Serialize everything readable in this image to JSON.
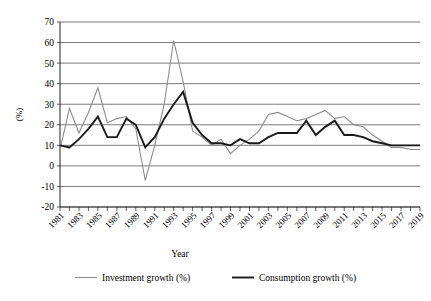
{
  "chart_data": {
    "type": "line",
    "title": "",
    "xlabel": "Year",
    "ylabel": "(%)",
    "ylim": [
      -20,
      70
    ],
    "ytick_step": 10,
    "yticks": [
      70,
      60,
      50,
      40,
      30,
      20,
      10,
      0,
      -10,
      -20
    ],
    "grid": true,
    "grid_axis": "y",
    "legend_position": "bottom",
    "x": [
      1981,
      1982,
      1983,
      1984,
      1985,
      1986,
      1987,
      1988,
      1989,
      1990,
      1991,
      1992,
      1993,
      1994,
      1995,
      1996,
      1997,
      1998,
      1999,
      2000,
      2001,
      2002,
      2003,
      2004,
      2005,
      2006,
      2007,
      2008,
      2009,
      2010,
      2011,
      2012,
      2013,
      2014,
      2015,
      2016,
      2017,
      2018,
      2019
    ],
    "xtick_labels": [
      "1981",
      "1983",
      "1985",
      "1987",
      "1989",
      "1991",
      "1993",
      "1995",
      "1997",
      "1999",
      "2001",
      "2003",
      "2005",
      "2007",
      "2009",
      "2011",
      "2013",
      "2015",
      "2017",
      "2019"
    ],
    "xtick_label_step": 2,
    "series": [
      {
        "name": "Investment growth (%)",
        "color": "#8c8c8c",
        "width": 1.1,
        "values": [
          8,
          28,
          16,
          26,
          38,
          21,
          23,
          24,
          18,
          -7,
          10,
          30,
          61,
          41,
          17,
          14,
          10,
          13,
          6,
          10,
          13,
          17,
          25,
          26,
          24,
          22,
          23,
          25,
          27,
          23,
          24,
          20,
          19,
          15,
          12,
          9,
          9,
          8,
          8
        ]
      },
      {
        "name": "Consumption growth (%)",
        "color": "#1a1a1a",
        "width": 1.9,
        "values": [
          10,
          9,
          13,
          18,
          24,
          14,
          14,
          23,
          20,
          9,
          14,
          23,
          30,
          36,
          21,
          15,
          11,
          11,
          10,
          13,
          11,
          11,
          14,
          16,
          16,
          16,
          22,
          15,
          19,
          22,
          15,
          15,
          14,
          12,
          11,
          10,
          10,
          10,
          10
        ]
      }
    ]
  },
  "axis": {
    "y_title": "(%)",
    "x_title": "Year"
  },
  "legend": {
    "items": [
      {
        "label": "Investment growth (%)",
        "color": "#8c8c8c",
        "width": 1.1
      },
      {
        "label": "Consumption growth (%)",
        "color": "#1a1a1a",
        "width": 1.9
      }
    ]
  }
}
